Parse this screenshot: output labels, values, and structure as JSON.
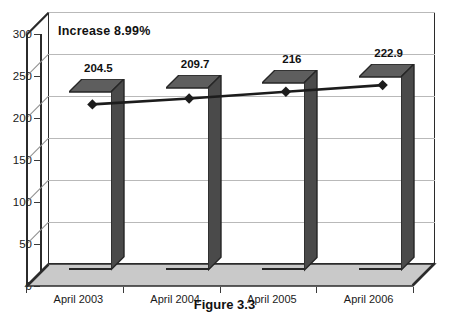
{
  "chart_data": {
    "type": "bar",
    "title": "",
    "subtitle": "",
    "xlabel": "",
    "ylabel": "",
    "categories": [
      "April 2003",
      "April 2004",
      "April 2005",
      "April 2006"
    ],
    "values": [
      204.5,
      209.7,
      216,
      222.9
    ],
    "value_labels": [
      "204.5",
      "209.7",
      "216",
      "222.9"
    ],
    "series": [
      {
        "name": "bars",
        "type": "bar",
        "values": [
          204.5,
          209.7,
          216,
          222.9
        ]
      },
      {
        "name": "trend-line",
        "type": "line",
        "marker": "diamond",
        "values": [
          190,
          197,
          205,
          213
        ]
      }
    ],
    "ylim": [
      0,
      300
    ],
    "ytick_values": [
      0,
      50,
      100,
      150,
      200,
      250,
      300
    ],
    "ytick_labels": [
      "0",
      "50",
      "100",
      "150",
      "200",
      "250",
      "300"
    ],
    "grid": true,
    "legend": "none",
    "annotations": [
      {
        "text": "Increase 8.99%",
        "position": "top-left-inside-plot"
      }
    ],
    "style": {
      "three_d": true,
      "bar_front_color": "#9b9b9b",
      "bar_top_color": "#5e5e5e",
      "bar_side_color": "#4a4a4a",
      "bar_outline_color": "#262626",
      "plot_background": "#ffffff",
      "floor_color": "#c9c9c9",
      "gridline_color": "#b9b9b9",
      "axis_color": "#2b2b2b",
      "line_color": "#1c1c1c",
      "marker_color": "#1c1c1c"
    }
  },
  "caption": {
    "text": "Figure 3.3"
  }
}
